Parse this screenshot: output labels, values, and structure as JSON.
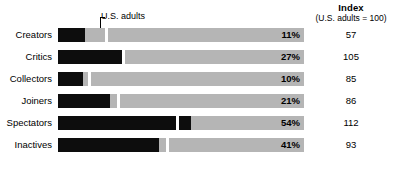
{
  "header": {
    "index_title": "Index",
    "index_subtitle": "(U.S. adults = 100)"
  },
  "annotation": {
    "label": "U.S. adults"
  },
  "colors": {
    "bar_fill": "#0d0d0d",
    "bar_track": "#b5b5b5",
    "marker": "#ffffff",
    "text": "#000000",
    "background": "#ffffff"
  },
  "chart_data": {
    "type": "bar",
    "title": "",
    "subtitle": "",
    "xlabel": "",
    "ylabel": "",
    "orientation": "horizontal",
    "grid": false,
    "legend": "none",
    "axis_max_percent": 100,
    "categories": [
      "Creators",
      "Critics",
      "Collectors",
      "Joiners",
      "Spectators",
      "Inactives"
    ],
    "series": [
      {
        "name": "Percent of segment",
        "values": [
          11,
          27,
          10,
          21,
          54,
          41
        ]
      },
      {
        "name": "Index (U.S. adults = 100)",
        "values": [
          57,
          105,
          85,
          86,
          112,
          93
        ]
      },
      {
        "name": "U.S. adults benchmark",
        "values": [
          19,
          26,
          12,
          24,
          48,
          44
        ]
      }
    ],
    "annotations": [
      {
        "text": "U.S. adults",
        "points_to": "white tick marker on each bar"
      }
    ],
    "rows": [
      {
        "label": "Creators",
        "percent": 11,
        "percent_label": "11%",
        "index": 57,
        "index_label": "57",
        "benchmark": 19
      },
      {
        "label": "Critics",
        "percent": 27,
        "percent_label": "27%",
        "index": 105,
        "index_label": "105",
        "benchmark": 26
      },
      {
        "label": "Collectors",
        "percent": 10,
        "percent_label": "10%",
        "index": 85,
        "index_label": "85",
        "benchmark": 12
      },
      {
        "label": "Joiners",
        "percent": 21,
        "percent_label": "21%",
        "index": 86,
        "index_label": "86",
        "benchmark": 24
      },
      {
        "label": "Spectators",
        "percent": 54,
        "percent_label": "54%",
        "index": 112,
        "index_label": "112",
        "benchmark": 48
      },
      {
        "label": "Inactives",
        "percent": 41,
        "percent_label": "41%",
        "index": 93,
        "index_label": "93",
        "benchmark": 44
      }
    ]
  }
}
